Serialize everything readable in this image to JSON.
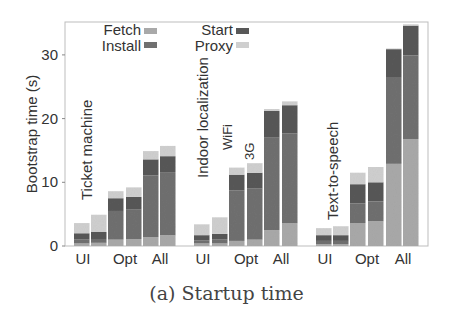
{
  "chart_data": {
    "type": "bar",
    "stacked": true,
    "title": "",
    "caption": "(a) Startup time",
    "xlabel": "",
    "ylabel": "Bootstrap time (s)",
    "ylim": [
      0,
      35
    ],
    "yticks": [
      0,
      10,
      20,
      30
    ],
    "grid": false,
    "legend": {
      "position": "upper-left, two columns",
      "entries": [
        {
          "name": "Fetch",
          "color": "#a9a9a9"
        },
        {
          "name": "Install",
          "color": "#707070"
        },
        {
          "name": "Start",
          "color": "#585858"
        },
        {
          "name": "Proxy",
          "color": "#cfcfcf"
        }
      ]
    },
    "stack_order": [
      "Fetch",
      "Install",
      "Start",
      "Proxy"
    ],
    "network_annotations": [
      "WiFi",
      "3G"
    ],
    "groups": [
      {
        "name": "Ticket machine",
        "tick_labels": [
          "UI",
          "Opt",
          "All"
        ],
        "bars": [
          {
            "config": "UI",
            "network": "WiFi",
            "Fetch": 0.4,
            "Install": 0.6,
            "Start": 1.0,
            "Proxy": 1.6
          },
          {
            "config": "UI",
            "network": "3G",
            "Fetch": 0.5,
            "Install": 0.6,
            "Start": 1.1,
            "Proxy": 2.7
          },
          {
            "config": "Opt",
            "network": "WiFi",
            "Fetch": 1.0,
            "Install": 4.5,
            "Start": 2.0,
            "Proxy": 1.1
          },
          {
            "config": "Opt",
            "network": "3G",
            "Fetch": 1.1,
            "Install": 4.6,
            "Start": 2.0,
            "Proxy": 1.5
          },
          {
            "config": "All",
            "network": "WiFi",
            "Fetch": 1.4,
            "Install": 9.7,
            "Start": 2.5,
            "Proxy": 1.3
          },
          {
            "config": "All",
            "network": "3G",
            "Fetch": 1.7,
            "Install": 9.9,
            "Start": 2.5,
            "Proxy": 1.6
          }
        ]
      },
      {
        "name": "Indoor localization",
        "tick_labels": [
          "UI",
          "Opt",
          "All"
        ],
        "bars": [
          {
            "config": "UI",
            "network": "WiFi",
            "Fetch": 0.4,
            "Install": 0.5,
            "Start": 0.8,
            "Proxy": 1.7
          },
          {
            "config": "UI",
            "network": "3G",
            "Fetch": 0.4,
            "Install": 0.6,
            "Start": 0.9,
            "Proxy": 2.6
          },
          {
            "config": "Opt",
            "network": "WiFi",
            "Fetch": 0.8,
            "Install": 7.9,
            "Start": 2.5,
            "Proxy": 1.1
          },
          {
            "config": "Opt",
            "network": "3G",
            "Fetch": 1.0,
            "Install": 8.0,
            "Start": 2.5,
            "Proxy": 1.5
          },
          {
            "config": "All",
            "network": "WiFi",
            "Fetch": 2.5,
            "Install": 14.5,
            "Start": 4.2,
            "Proxy": 0.3
          },
          {
            "config": "All",
            "network": "3G",
            "Fetch": 3.6,
            "Install": 14.1,
            "Start": 4.4,
            "Proxy": 0.6
          }
        ]
      },
      {
        "name": "Text-to-speech",
        "tick_labels": [
          "UI",
          "Opt",
          "All"
        ],
        "bars": [
          {
            "config": "UI",
            "network": "WiFi",
            "Fetch": 0.3,
            "Install": 0.5,
            "Start": 0.9,
            "Proxy": 1.1
          },
          {
            "config": "UI",
            "network": "3G",
            "Fetch": 0.3,
            "Install": 0.5,
            "Start": 0.9,
            "Proxy": 1.4
          },
          {
            "config": "Opt",
            "network": "WiFi",
            "Fetch": 3.6,
            "Install": 3.1,
            "Start": 3.0,
            "Proxy": 1.8
          },
          {
            "config": "Opt",
            "network": "3G",
            "Fetch": 3.9,
            "Install": 3.1,
            "Start": 3.0,
            "Proxy": 2.4
          },
          {
            "config": "All",
            "network": "WiFi",
            "Fetch": 12.9,
            "Install": 13.5,
            "Start": 4.5,
            "Proxy": 0.1
          },
          {
            "config": "All",
            "network": "3G",
            "Fetch": 16.8,
            "Install": 13.1,
            "Start": 4.7,
            "Proxy": 0.2
          }
        ]
      }
    ]
  },
  "layout": {
    "plot_left": 65,
    "plot_right": 428,
    "plot_top": 22,
    "plot_bottom": 246,
    "px_per_unit": 6.37,
    "bar_width": 15.5,
    "bar_x": [
      [
        74,
        91,
        108,
        126,
        143,
        160
      ],
      [
        194,
        212,
        229,
        247,
        264,
        282
      ],
      [
        316,
        333,
        350,
        368,
        386,
        403
      ]
    ],
    "tick_x": [
      [
        83,
        125,
        160
      ],
      [
        203,
        246,
        281
      ],
      [
        325,
        367,
        403
      ]
    ],
    "group_label_pos": [
      [
        92,
        200
      ],
      [
        208,
        178
      ],
      [
        338,
        220
      ]
    ],
    "net_label_pos": [
      [
        232,
        150
      ],
      [
        254,
        160
      ]
    ]
  }
}
